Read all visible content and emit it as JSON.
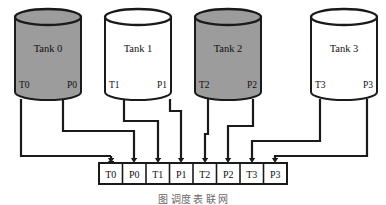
{
  "diagram": {
    "colors": {
      "stroke": "#1a1a1a",
      "tank_filled": "#9c9c9c",
      "tank_empty": "#ffffff",
      "background": "#ffffff",
      "caption": "#6a6a6a"
    },
    "tanks": [
      {
        "label": "Tank 0",
        "filled": true,
        "temp_port": "T0",
        "press_port": "P0"
      },
      {
        "label": "Tank 1",
        "filled": false,
        "temp_port": "T1",
        "press_port": "P1"
      },
      {
        "label": "Tank 2",
        "filled": true,
        "temp_port": "T2",
        "press_port": "P2"
      },
      {
        "label": "Tank 3",
        "filled": false,
        "temp_port": "T3",
        "press_port": "P3"
      }
    ],
    "register_row": {
      "cells": [
        "T0",
        "P0",
        "T1",
        "P1",
        "T2",
        "P2",
        "T3",
        "P3"
      ]
    },
    "caption": "图 调度 表 联 网"
  }
}
